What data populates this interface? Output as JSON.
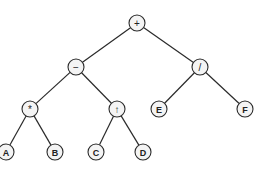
{
  "diagram": {
    "type": "expression-tree",
    "node_radius": 8,
    "colors": {
      "stroke": "#2a2a2a",
      "fill": "#f4f4f4",
      "text": "#222222"
    },
    "nodes": [
      {
        "id": "plus",
        "label": "+",
        "kind": "operator",
        "x": 137,
        "y": 23
      },
      {
        "id": "minus",
        "label": "−",
        "kind": "operator",
        "x": 76,
        "y": 67
      },
      {
        "id": "div",
        "label": "/",
        "kind": "operator",
        "x": 200,
        "y": 67
      },
      {
        "id": "mul",
        "label": "*",
        "kind": "operator",
        "x": 30,
        "y": 109
      },
      {
        "id": "pow",
        "label": "↑",
        "kind": "operator",
        "x": 117,
        "y": 109
      },
      {
        "id": "E",
        "label": "E",
        "kind": "operand",
        "x": 159,
        "y": 109
      },
      {
        "id": "F",
        "label": "F",
        "kind": "operand",
        "x": 245,
        "y": 109
      },
      {
        "id": "A",
        "label": "A",
        "kind": "operand",
        "x": 6,
        "y": 152
      },
      {
        "id": "B",
        "label": "B",
        "kind": "operand",
        "x": 55,
        "y": 152
      },
      {
        "id": "C",
        "label": "C",
        "kind": "operand",
        "x": 96,
        "y": 152
      },
      {
        "id": "D",
        "label": "D",
        "kind": "operand",
        "x": 143,
        "y": 152
      }
    ],
    "edges": [
      [
        "plus",
        "minus"
      ],
      [
        "plus",
        "div"
      ],
      [
        "minus",
        "mul"
      ],
      [
        "minus",
        "pow"
      ],
      [
        "div",
        "E"
      ],
      [
        "div",
        "F"
      ],
      [
        "mul",
        "A"
      ],
      [
        "mul",
        "B"
      ],
      [
        "pow",
        "C"
      ],
      [
        "pow",
        "D"
      ]
    ]
  }
}
